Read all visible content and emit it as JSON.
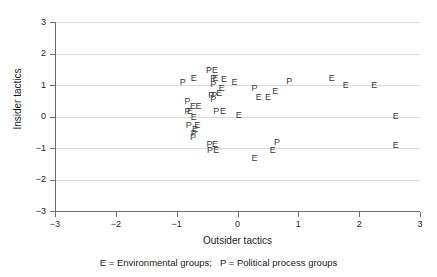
{
  "chart_data": {
    "type": "scatter",
    "title": "",
    "xlabel": "Outsider tactics",
    "ylabel": "Insider tactics",
    "xlim": [
      -3,
      3
    ],
    "ylim": [
      -3,
      3
    ],
    "xticks": [
      "-3",
      "-2",
      "-1",
      "0",
      "1",
      "2",
      "3"
    ],
    "yticks": [
      "3",
      "2",
      "1",
      "0",
      "-1",
      "-2",
      "-3"
    ],
    "xtick_values": [
      -3,
      -2,
      -1,
      0,
      1,
      2,
      3
    ],
    "ytick_values": [
      3,
      2,
      1,
      0,
      -1,
      -2,
      -3
    ],
    "grid": "horizontal gridlines only",
    "legend_position": "below axis as caption",
    "marker_style": "text letter markers (E / P)",
    "caption": "E = Environmental groups;   P = Political process groups",
    "legend": [
      {
        "marker": "E",
        "label": "Environmental groups"
      },
      {
        "marker": "P",
        "label": "Political process groups"
      }
    ],
    "series": [
      {
        "name": "Environmental groups",
        "marker": "E",
        "points": [
          {
            "x": -0.37,
            "y": 1.45
          },
          {
            "x": -0.72,
            "y": 1.2
          },
          {
            "x": -0.36,
            "y": 1.2
          },
          {
            "x": -0.22,
            "y": 1.15
          },
          {
            "x": -0.05,
            "y": 1.05
          },
          {
            "x": 1.55,
            "y": 1.18
          },
          {
            "x": 1.78,
            "y": 0.98
          },
          {
            "x": 2.25,
            "y": 0.98
          },
          {
            "x": -0.26,
            "y": 0.88
          },
          {
            "x": 0.62,
            "y": 0.78
          },
          {
            "x": -0.3,
            "y": 0.72
          },
          {
            "x": 0.35,
            "y": 0.6
          },
          {
            "x": 0.5,
            "y": 0.6
          },
          {
            "x": -0.73,
            "y": 0.3
          },
          {
            "x": -0.64,
            "y": 0.3
          },
          {
            "x": -0.24,
            "y": 0.15
          },
          {
            "x": -0.78,
            "y": 0.13
          },
          {
            "x": 0.02,
            "y": 0.02
          },
          {
            "x": 2.6,
            "y": 0.0
          },
          {
            "x": -0.72,
            "y": -0.05
          },
          {
            "x": -0.66,
            "y": -0.3
          },
          {
            "x": -0.7,
            "y": -0.42
          },
          {
            "x": -0.37,
            "y": -0.92
          },
          {
            "x": -0.35,
            "y": -1.1
          },
          {
            "x": 0.58,
            "y": -1.08
          },
          {
            "x": 0.28,
            "y": -1.35
          },
          {
            "x": 2.6,
            "y": -0.95
          }
        ]
      },
      {
        "name": "Political process groups",
        "marker": "P",
        "points": [
          {
            "x": -0.47,
            "y": 1.45
          },
          {
            "x": -0.9,
            "y": 1.05
          },
          {
            "x": -0.4,
            "y": 1.2
          },
          {
            "x": -0.4,
            "y": 1.0
          },
          {
            "x": 0.85,
            "y": 1.1
          },
          {
            "x": 0.28,
            "y": 0.88
          },
          {
            "x": -0.43,
            "y": 0.65
          },
          {
            "x": -0.38,
            "y": 0.65
          },
          {
            "x": -0.4,
            "y": 0.52
          },
          {
            "x": -0.82,
            "y": 0.45
          },
          {
            "x": -0.82,
            "y": 0.15
          },
          {
            "x": -0.35,
            "y": 0.14
          },
          {
            "x": -0.8,
            "y": -0.3
          },
          {
            "x": -0.72,
            "y": -0.55
          },
          {
            "x": -0.73,
            "y": -0.68
          },
          {
            "x": -0.46,
            "y": -0.92
          },
          {
            "x": -0.45,
            "y": -1.1
          },
          {
            "x": 0.65,
            "y": -0.85
          }
        ]
      }
    ]
  }
}
